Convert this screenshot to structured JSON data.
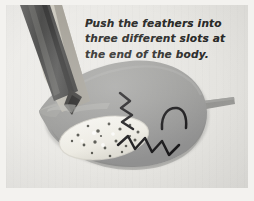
{
  "image": {
    "kind": "craft-instruction-photograph",
    "subject": "felt bird body with pencil making feather slots",
    "background_color": "#e9e8e4",
    "frame_color": "#f3f2ef"
  },
  "instruction": {
    "name": "instruction-caption",
    "full_text": "Push the feathers into three different slots at the end of the body.",
    "lines": [
      "Push the feathers into",
      "three different slots at",
      "the end of the body."
    ],
    "text_color": "#2a2a28"
  },
  "objects": {
    "bird_body": {
      "label": "bird-body",
      "color": "#9d9d9b",
      "shadow_color": "#8d8d8b",
      "description": "large gray teardrop/leaf shaped felt bird body with pointed beak at left"
    },
    "bird_beak": {
      "label": "bird-beak",
      "color": "#a3a3a0"
    },
    "wing": {
      "label": "speckled-wing",
      "color": "#f0efe9",
      "speckle_color": "#5b5b57",
      "description": "white oval speckled wing patch on lower left of body"
    },
    "tail_stick": {
      "label": "tail-stick",
      "color": "#8e8e8c",
      "description": "flat gray stick protruding right from body"
    },
    "pencil": {
      "label": "pencil",
      "barrel_color": "#545453",
      "barrel_highlight": "#6e6e6d",
      "wood_color": "#d8d5cc",
      "wood_shade": "#b9b6ad",
      "graphite_color": "#3b3a38",
      "description": "sharpened pencil angled from upper left, tip pressed into bird body"
    },
    "slot_marks": {
      "label": "slot-marks",
      "ink_color": "#19181a",
      "count": 3,
      "items": [
        {
          "name": "slot-mark-upper-zigzag",
          "shape": "zigzag"
        },
        {
          "name": "slot-mark-arc",
          "shape": "arc"
        },
        {
          "name": "slot-mark-lower-zigzag",
          "shape": "zigzag"
        }
      ]
    }
  }
}
